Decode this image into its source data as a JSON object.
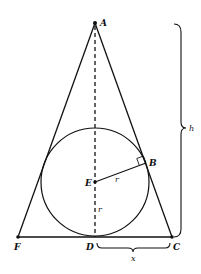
{
  "diagram": {
    "points": {
      "A": {
        "label": "A",
        "x": 95,
        "y": 23
      },
      "B": {
        "label": "B",
        "x": 146,
        "y": 163
      },
      "C": {
        "label": "C",
        "x": 172,
        "y": 237
      },
      "D": {
        "label": "D",
        "x": 95,
        "y": 237
      },
      "E": {
        "label": "E",
        "x": 95,
        "y": 182
      },
      "F": {
        "label": "F",
        "x": 18,
        "y": 237
      }
    },
    "circle": {
      "center": "E",
      "radius_label": "r",
      "radius_px": 54
    },
    "segments": [
      {
        "from": "A",
        "to": "F",
        "style": "solid"
      },
      {
        "from": "A",
        "to": "C",
        "style": "solid"
      },
      {
        "from": "F",
        "to": "C",
        "style": "solid"
      },
      {
        "from": "A",
        "to": "D",
        "style": "dashed"
      },
      {
        "from": "E",
        "to": "B",
        "style": "solid",
        "label": "r"
      }
    ],
    "labels": {
      "A": "A",
      "B": "B",
      "C": "C",
      "D": "D",
      "E": "E",
      "F": "F",
      "r_EB": "r",
      "r_ED": "r",
      "height": "h",
      "half_base": "x"
    },
    "colors": {
      "ink": "#111111",
      "background": "#ffffff"
    }
  }
}
